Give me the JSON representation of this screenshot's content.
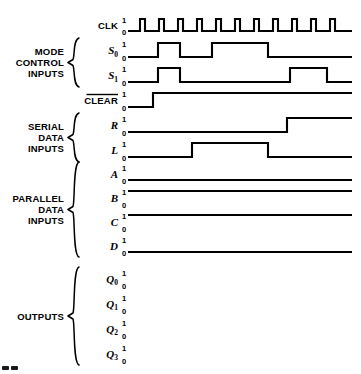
{
  "figure": {
    "width": 361,
    "height": 374,
    "background": "#ffffff",
    "ink": "#000000"
  },
  "groups": [
    {
      "id": "mode-control-inputs",
      "lines": [
        "MODE",
        "CONTROL",
        "INPUTS"
      ],
      "brace": true,
      "members": [
        "S0",
        "S1"
      ]
    },
    {
      "id": "serial-data-inputs",
      "lines": [
        "SERIAL",
        "DATA",
        "INPUTS"
      ],
      "brace": true,
      "members": [
        "R",
        "L"
      ]
    },
    {
      "id": "parallel-data-inputs",
      "lines": [
        "PARALLEL",
        "DATA",
        "INPUTS"
      ],
      "brace": true,
      "members": [
        "A",
        "B",
        "C",
        "D"
      ]
    },
    {
      "id": "outputs",
      "lines": [
        "OUTPUTS"
      ],
      "brace": true,
      "members": [
        "Q0",
        "Q1",
        "Q2",
        "Q3"
      ]
    }
  ],
  "level_labels": {
    "high": "1",
    "low": "0"
  },
  "signals": [
    {
      "id": "CLK",
      "label": "CLK",
      "label_style": "plain",
      "sub": "",
      "overline": false,
      "group": null
    },
    {
      "id": "S0",
      "label": "S",
      "label_style": "italic",
      "sub": "0",
      "overline": false,
      "group": "mode-control-inputs"
    },
    {
      "id": "S1",
      "label": "S",
      "label_style": "italic",
      "sub": "1",
      "overline": false,
      "group": "mode-control-inputs"
    },
    {
      "id": "CLEAR",
      "label": "CLEAR",
      "label_style": "plain",
      "sub": "",
      "overline": true,
      "group": null
    },
    {
      "id": "R",
      "label": "R",
      "label_style": "italic",
      "sub": "",
      "overline": false,
      "group": "serial-data-inputs"
    },
    {
      "id": "L",
      "label": "L",
      "label_style": "italic",
      "sub": "",
      "overline": false,
      "group": "serial-data-inputs"
    },
    {
      "id": "A",
      "label": "A",
      "label_style": "italic",
      "sub": "",
      "overline": false,
      "group": "parallel-data-inputs"
    },
    {
      "id": "B",
      "label": "B",
      "label_style": "italic",
      "sub": "",
      "overline": false,
      "group": "parallel-data-inputs"
    },
    {
      "id": "C",
      "label": "C",
      "label_style": "italic",
      "sub": "",
      "overline": false,
      "group": "parallel-data-inputs"
    },
    {
      "id": "D",
      "label": "D",
      "label_style": "italic",
      "sub": "",
      "overline": false,
      "group": "parallel-data-inputs"
    },
    {
      "id": "Q0",
      "label": "Q",
      "label_style": "italic",
      "sub": "0",
      "overline": false,
      "group": "outputs"
    },
    {
      "id": "Q1",
      "label": "Q",
      "label_style": "italic",
      "sub": "1",
      "overline": false,
      "group": "outputs"
    },
    {
      "id": "Q2",
      "label": "Q",
      "label_style": "italic",
      "sub": "2",
      "overline": false,
      "group": "outputs"
    },
    {
      "id": "Q3",
      "label": "Q",
      "label_style": "italic",
      "sub": "3",
      "overline": false,
      "group": "outputs"
    }
  ],
  "chart_data": {
    "type": "line",
    "xlabel": "",
    "ylabel": "",
    "note": "Digital timing waveforms. Each signal is a binary sequence of transitions; value 1 = high level, 0 = low level. x values are pixel positions along the common time axis from x_start to x_end.",
    "x_start": 128,
    "x_end": 352,
    "y_levels": {
      "1": "high",
      "0": "low"
    },
    "series": [
      {
        "name": "CLK",
        "initial": 0,
        "transitions": [
          140,
          145,
          159,
          164,
          178,
          183,
          197,
          202,
          216,
          221,
          235,
          240,
          254,
          259,
          273,
          278,
          292,
          297,
          311,
          316,
          330,
          335
        ],
        "description": "11 clock pulses, low-high-low repeating, period about 19 px, pulse width about 5 px",
        "pulse_count": 11
      },
      {
        "name": "S0",
        "initial": 0,
        "transitions": [
          158,
          180,
          212,
          268
        ],
        "description": "Starts low at left edge of its trace, rises at 158, falls at 180, rises at 212, falls at 268, then stays low"
      },
      {
        "name": "S1",
        "initial": 0,
        "transitions": [
          158,
          180,
          290,
          327
        ],
        "description": "Starts low, rises at 158, falls at 180, rises at 290, falls at 327, then stays low"
      },
      {
        "name": "CLEAR",
        "initial": 0,
        "transitions": [
          153
        ],
        "description": "Active-low clear. Low from start, rises at 153, remains high for remainder",
        "overline": true
      },
      {
        "name": "R",
        "initial": 0,
        "transitions": [
          287
        ],
        "description": "Low from start, rises at 287, remains high for remainder"
      },
      {
        "name": "L",
        "initial": 0,
        "transitions": [
          192,
          268
        ],
        "description": "Low from start, rises at 192, falls at 268, remains low"
      },
      {
        "name": "A",
        "initial": 0,
        "transitions": [],
        "description": "Constant low (logic 0) for entire diagram"
      },
      {
        "name": "B",
        "initial": 1,
        "transitions": [],
        "description": "Constant high (logic 1) for entire diagram"
      },
      {
        "name": "C",
        "initial": 1,
        "transitions": [],
        "description": "Constant high (logic 1) for entire diagram"
      },
      {
        "name": "D",
        "initial": 0,
        "transitions": [],
        "description": "Constant low (logic 0) for entire diagram"
      },
      {
        "name": "Q0",
        "initial": null,
        "transitions": [],
        "description": "No waveform drawn; axis levels only"
      },
      {
        "name": "Q1",
        "initial": null,
        "transitions": [],
        "description": "No waveform drawn; axis levels only"
      },
      {
        "name": "Q2",
        "initial": null,
        "transitions": [],
        "description": "No waveform drawn; axis levels only"
      },
      {
        "name": "Q3",
        "initial": null,
        "transitions": [],
        "description": "No waveform drawn; axis levels only"
      }
    ]
  }
}
